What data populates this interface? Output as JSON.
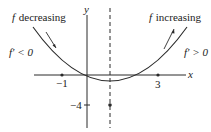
{
  "figure": {
    "type": "function-graph",
    "function": "f(x) = (x+1)(x-3)",
    "axes": {
      "x_label": "x",
      "y_label": "y",
      "x_ticks": [
        {
          "value": -1,
          "label": "−1"
        },
        {
          "value": 3,
          "label": "3"
        }
      ],
      "y_ticks": [
        {
          "value": -4,
          "label": "−4"
        }
      ]
    },
    "vertex": {
      "x": 1,
      "y": -4
    },
    "dashed_line": {
      "x": 1
    },
    "annotations": {
      "left_title": "f decreasing",
      "left_title_f": "f",
      "left_title_word": "decreasing",
      "left_condition": "f′ < 0",
      "right_title": "f increasing",
      "right_title_f": "f",
      "right_title_word": "increasing",
      "right_condition": "f′ > 0"
    },
    "colors": {
      "stroke": "#2a2a2a",
      "text": "#222222",
      "background": "#ffffff"
    }
  }
}
